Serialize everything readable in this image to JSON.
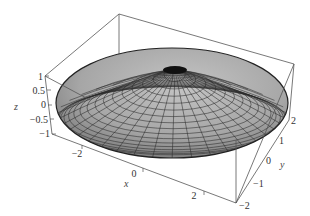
{
  "chart_data": {
    "type": "surface3d",
    "title": "",
    "surface": {
      "shape": "ellipsoid",
      "center": [
        0,
        0,
        0
      ],
      "semi_axes": {
        "x": 3,
        "y": 2,
        "z": 1
      },
      "color": "#a8a8a8",
      "mesh_color": "#2a2a2a"
    },
    "axes": {
      "x": {
        "label": "x",
        "range": [
          -3,
          3
        ],
        "ticks": [
          "-2",
          "0",
          "2"
        ]
      },
      "y": {
        "label": "y",
        "range": [
          -2,
          2
        ],
        "ticks": [
          "-2",
          "-1",
          "0",
          "1",
          "2"
        ]
      },
      "z": {
        "label": "z",
        "range": [
          -1,
          1
        ],
        "ticks": [
          "1",
          "0.5",
          "0",
          "-0.5",
          "-1"
        ]
      }
    },
    "box": true,
    "grid": false,
    "legend": null
  },
  "labels": {
    "x_axis": "x",
    "y_axis": "y",
    "z_axis": "z",
    "z_ticks": [
      "1",
      "0.5",
      "0",
      "−0.5",
      "−1"
    ],
    "x_ticks": [
      "−2",
      "0",
      "2"
    ],
    "y_ticks": [
      "−2",
      "−1",
      "0",
      "1",
      "2"
    ]
  }
}
